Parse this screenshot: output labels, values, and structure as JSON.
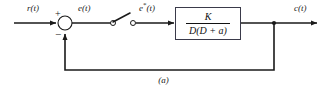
{
  "figure": {
    "caption": "(a)",
    "type": "control-system-block-diagram",
    "line_color": "#1a1a1a",
    "block_border_color": "#3a3a4a",
    "background": "#ffffff"
  },
  "signals": {
    "input_label": "r(t)",
    "error_label": "e(t)",
    "sampled_error_base": "e",
    "sampled_error_star": "*",
    "sampled_error_suffix": "(t)",
    "output_label": "c(t)"
  },
  "summing_junction": {
    "name": "summing-junction",
    "plus_sign": "+",
    "minus_sign": "−",
    "center_x": 65,
    "center_y": 23,
    "radius": 7
  },
  "sampler": {
    "name": "sampler-switch",
    "state": "open",
    "left_contact_x": 113,
    "right_contact_x": 133,
    "contact_y": 23
  },
  "transfer_function": {
    "numerator": "K",
    "denominator": "D(D + a)",
    "x": 175,
    "y": 7,
    "width": 66,
    "height": 33
  },
  "feedback": {
    "takeoff_x": 274,
    "bottom_y": 70,
    "return_x": 65,
    "unity_gain": true
  }
}
